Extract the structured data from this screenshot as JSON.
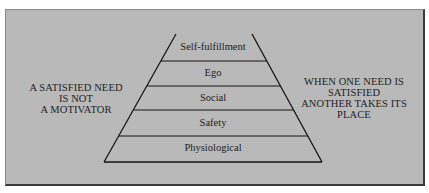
{
  "diagram": {
    "type": "pyramid",
    "title": "",
    "levels": [
      {
        "label": "Self-fulfillment",
        "rank": 5
      },
      {
        "label": "Ego",
        "rank": 4
      },
      {
        "label": "Social",
        "rank": 3
      },
      {
        "label": "Safety",
        "rank": 2
      },
      {
        "label": "Physiological",
        "rank": 1
      }
    ],
    "left_note": {
      "lines": [
        "A SATISFIED NEED",
        "IS NOT",
        "A MOTIVATOR"
      ]
    },
    "right_note": {
      "lines": [
        "WHEN ONE NEED IS",
        "SATISFIED",
        "ANOTHER TAKES ITS",
        "PLACE"
      ]
    },
    "colors": {
      "background": "#b9b9b9",
      "line": "#141414",
      "text": "#1e1e1e",
      "shadow": "#3a3a3a"
    }
  }
}
